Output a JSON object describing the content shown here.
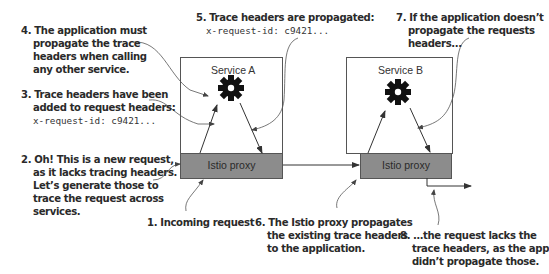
{
  "services": [
    {
      "id": "a",
      "title": "Service A",
      "proxy_label": "Istio proxy"
    },
    {
      "id": "b",
      "title": "Service B",
      "proxy_label": "Istio proxy"
    }
  ],
  "annotations": {
    "a1": {
      "num": "1.",
      "lines": [
        "Incoming request"
      ]
    },
    "a2": {
      "num": "2.",
      "lines": [
        "Oh! This is a new request,",
        "as it lacks tracing headers.",
        "Let’s generate those to",
        "trace the request across",
        "services."
      ]
    },
    "a3": {
      "num": "3.",
      "lines": [
        "Trace headers have been",
        "added to request headers:"
      ],
      "code": "x-request-id: c9421..."
    },
    "a4": {
      "num": "4.",
      "lines": [
        "The application must",
        "propagate the trace",
        "headers when calling",
        "any other service."
      ]
    },
    "a5": {
      "num": "5.",
      "lines": [
        "Trace headers are propagated:"
      ],
      "code": "x-request-id: c9421..."
    },
    "a6": {
      "num": "6.",
      "lines": [
        "The Istio proxy propagates",
        "the existing trace headers",
        "to the application."
      ]
    },
    "a7": {
      "num": "7.",
      "lines": [
        "If the application doesn’t",
        "propagate the requests",
        "headers..."
      ]
    },
    "a8": {
      "num": "8.",
      "lines": [
        "…the request lacks the",
        "trace headers, as the app",
        "didn’t propagate those."
      ]
    }
  },
  "icons": {
    "application": "gear-icon"
  },
  "colors": {
    "proxy_fill": "#8c8c8c",
    "box_stroke": "#555555",
    "arrow": "#333333",
    "text": "#2a2a2a"
  }
}
